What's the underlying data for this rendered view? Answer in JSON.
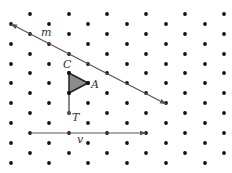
{
  "diagram": {
    "type": "isometric-dot-grid-transformation",
    "colors": {
      "background": "#ffffff",
      "dot": "#111111",
      "line": "#555555",
      "triangle_fill": "#8c8c8c",
      "triangle_stroke": "#222222",
      "label": "#333333"
    },
    "grid": {
      "columns_x": [
        11,
        30,
        49,
        69,
        88,
        107,
        127,
        146,
        166,
        185,
        205,
        224
      ],
      "even_column_rows_y": [
        24,
        44,
        64,
        83,
        103,
        123,
        143,
        163
      ],
      "odd_column_rows_y": [
        14,
        34,
        54,
        73,
        93,
        113,
        133,
        153
      ]
    },
    "line_m": {
      "label": "m",
      "start": [
        11,
        24
      ],
      "end": [
        166,
        104
      ],
      "label_pos": [
        41,
        36
      ],
      "arrowheads": "both"
    },
    "triangle": {
      "vertices": [
        [
          69,
          73
        ],
        [
          88,
          83
        ],
        [
          69,
          93
        ]
      ],
      "labels": {
        "C": {
          "text": "C",
          "pos": [
            63,
            68
          ]
        },
        "A": {
          "text": "A",
          "pos": [
            91,
            88
          ]
        }
      }
    },
    "segment_T": {
      "start": [
        69,
        93
      ],
      "end": [
        69,
        113
      ],
      "label": "T",
      "label_pos": [
        72,
        121
      ]
    },
    "vector_v": {
      "label": "v",
      "start": [
        30,
        133
      ],
      "end": [
        146,
        133
      ],
      "label_pos": [
        77,
        143
      ],
      "arrowhead": "end"
    }
  }
}
